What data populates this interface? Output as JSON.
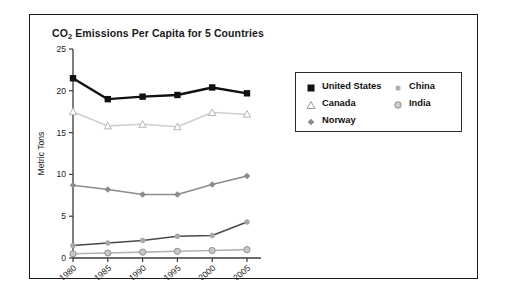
{
  "chart_data": {
    "type": "line",
    "title": "CO2 Emissions Per Capita for 5 Countries",
    "title_main": "CO",
    "title_sub": "2",
    "title_rest": " Emissions Per Capita for 5 Countries",
    "xlabel": "",
    "ylabel": "Metric Tons",
    "categories": [
      "1980",
      "1985",
      "1990",
      "1995",
      "2000",
      "2005"
    ],
    "x": [
      1980,
      1985,
      1990,
      1995,
      2000,
      2005
    ],
    "xlim": [
      1978,
      2007
    ],
    "ylim": [
      0,
      25
    ],
    "yticks": [
      "0",
      "5",
      "10",
      "15",
      "20",
      "25"
    ],
    "ytick_values": [
      0,
      5,
      10,
      15,
      20,
      25
    ],
    "grid": false,
    "legend_position": "upper right (inside plot)",
    "series": [
      {
        "name": "United States",
        "values": [
          21.5,
          19.0,
          19.3,
          19.5,
          20.4,
          19.7
        ],
        "color": "#111111",
        "marker": "filled-square"
      },
      {
        "name": "Canada",
        "values": [
          17.5,
          15.8,
          16.0,
          15.7,
          17.4,
          17.2
        ],
        "color": "#cfcfcf",
        "marker_color": "#ffffff",
        "marker_edge": "#b5b5b5",
        "marker": "open-triangle"
      },
      {
        "name": "Norway",
        "values": [
          8.7,
          8.2,
          7.6,
          7.6,
          8.8,
          9.8
        ],
        "color": "#8c8c8c",
        "marker": "diamond"
      },
      {
        "name": "China",
        "values": [
          1.5,
          1.8,
          2.1,
          2.6,
          2.7,
          4.3
        ],
        "color": "#4a4a4a",
        "marker_color": "#a8a8a8",
        "marker": "small-dot"
      },
      {
        "name": "India",
        "values": [
          0.5,
          0.6,
          0.7,
          0.8,
          0.9,
          1.0
        ],
        "color": "#b3b3b3",
        "marker_color": "#c9c9c9",
        "marker_edge": "#8f8f8f",
        "marker": "circle"
      }
    ]
  },
  "legend": {
    "entries": [
      {
        "label": "United States",
        "marker": "filled-square"
      },
      {
        "label": "Canada",
        "marker": "open-triangle"
      },
      {
        "label": "Norway",
        "marker": "diamond"
      },
      {
        "label": "China",
        "marker": "small-dot"
      },
      {
        "label": "India",
        "marker": "circle"
      }
    ]
  },
  "colors": {
    "frame": "#1a1a1a",
    "axis": "#3a3a3a",
    "text": "#1a1a1a",
    "background": "#ffffff"
  }
}
